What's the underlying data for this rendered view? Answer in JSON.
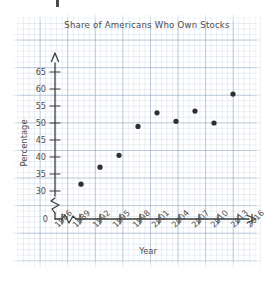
{
  "chart_data": {
    "type": "scatter",
    "title": "Share of Americans Who Own Stocks",
    "xlabel": "Year",
    "ylabel": "Percentage",
    "x": [
      1989,
      1992,
      1995,
      1998,
      2001,
      2004,
      2007,
      2010,
      2013
    ],
    "values": [
      32,
      37,
      40.5,
      49,
      53,
      50.5,
      53.5,
      50,
      58.5
    ],
    "x_tick_labels": [
      "1986",
      "1989",
      "1992",
      "1995",
      "1998",
      "2001",
      "2004",
      "2007",
      "2010",
      "2013",
      "2016"
    ],
    "y_tick_labels": [
      "0",
      "30",
      "35",
      "40",
      "45",
      "50",
      "55",
      "60",
      "65"
    ],
    "xlim": [
      1986,
      2016
    ],
    "ylim": [
      28,
      67
    ],
    "y_axis_break": true,
    "x_axis_break": true,
    "grid": true,
    "legend": null,
    "point_color": "#2f2f33",
    "axis_color": "#3a3a3a",
    "grid_color": "#96aac3"
  },
  "labels": {
    "title": "Share of Americans Who Own Stocks",
    "y_axis_title": "Percentage",
    "x_axis_title": "Year",
    "y_ticks": [
      "65",
      "60",
      "55",
      "50",
      "45",
      "40",
      "35",
      "30",
      "0"
    ],
    "x_ticks": [
      "1986",
      "1989",
      "1992",
      "1995",
      "1998",
      "2001",
      "2004",
      "2007",
      "2010",
      "2013",
      "2016"
    ]
  }
}
